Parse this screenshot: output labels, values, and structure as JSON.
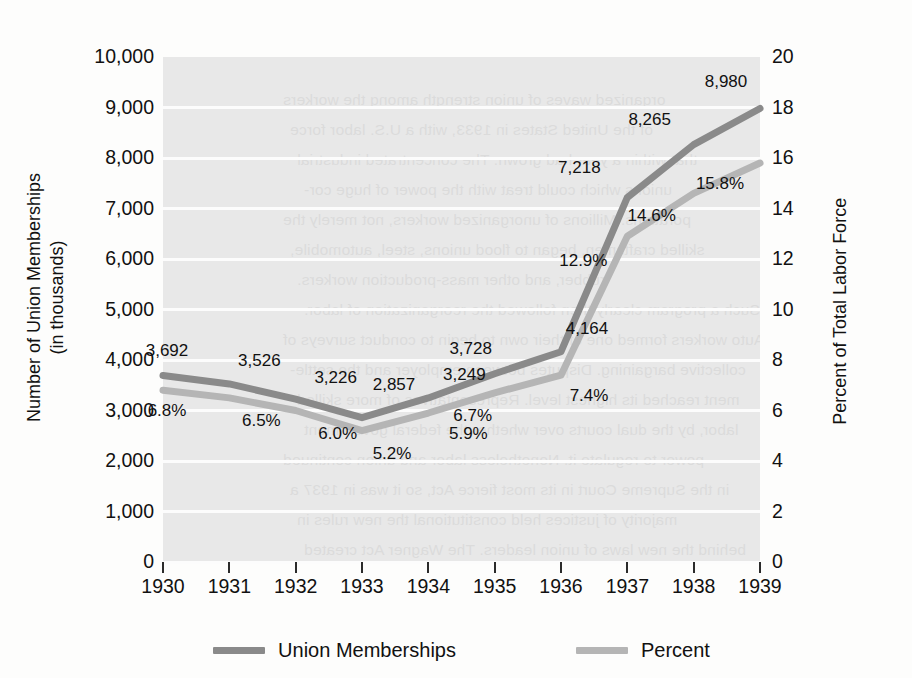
{
  "chart_data": {
    "type": "line",
    "title": "",
    "xlabel": "",
    "categories": [
      "1930",
      "1931",
      "1932",
      "1933",
      "1934",
      "1935",
      "1936",
      "1937",
      "1938",
      "1939"
    ],
    "grid": true,
    "legend_position": "bottom",
    "series": [
      {
        "name": "Union Memberships",
        "axis": "left",
        "color": "#8a8a8a",
        "ylabel": "Number of Union Memberships\n(in thousands)",
        "ylim": [
          0,
          10000
        ],
        "yticks": [
          "10,000",
          "9,000",
          "8,000",
          "7,000",
          "6,000",
          "5,000",
          "4,000",
          "3,000",
          "2,000",
          "1,000",
          "0"
        ],
        "values": [
          3692,
          3526,
          3226,
          2857,
          3249,
          3728,
          4164,
          7218,
          8265,
          8980
        ],
        "labels": [
          "3,692",
          "3,526",
          "3,226",
          "2,857",
          "3,249",
          "3,728",
          "4,164",
          "7,218",
          "8,265",
          "8,980"
        ]
      },
      {
        "name": "Percent",
        "axis": "right",
        "color": "#b5b5b5",
        "ylabel": "Percent of Total Labor Force",
        "ylim": [
          0,
          20
        ],
        "yticks": [
          "20",
          "18",
          "16",
          "14",
          "12",
          "10",
          "8",
          "6",
          "4",
          "2",
          "0"
        ],
        "values": [
          6.8,
          6.5,
          6.0,
          5.2,
          5.9,
          6.7,
          7.4,
          12.9,
          14.6,
          15.8
        ],
        "labels": [
          "6.8%",
          "6.5%",
          "6.0%",
          "5.2%",
          "5.9%",
          "6.7%",
          "7.4%",
          "12.9%",
          "14.6%",
          "15.8%"
        ]
      }
    ]
  },
  "axis_titles": {
    "left_line1": "Number of Union Memberships",
    "left_line2": "(in thousands)",
    "right": "Percent of Total Labor Force"
  },
  "legend": {
    "items": [
      {
        "label": "Union Memberships",
        "color": "#8a8a8a"
      },
      {
        "label": "Percent",
        "color": "#b5b5b5"
      }
    ]
  },
  "bleed_text": [
    "organized waves of union strength among the workers",
    "of the United States in 1933, with a U.S. labor force",
    "that within a year had grown. The concentrated industrial",
    "unions which could treat with the power of huge cor-",
    "porations. Millions of unorganized workers, not merely the",
    "skilled craftsmen, began to flood unions, steel, automobile,",
    "rubber, and other mass-production workers.",
    "Such a program clearly then followed the reorganization of labor.",
    "Auto workers formed one of their own to begin to conduct surveys of",
    "collective bargaining. Disputes between employer and the settle-",
    "ment reached its highest level. Representatives of more skilled",
    "labor, by the dual courts over whether the federal government",
    "power to regulate it. Nonetheless labor and union continued",
    "in the Supreme Court in its most fierce Act, so it was in 1937 a",
    "majority of justices held constitutional the new rules in",
    "behind the new laws of union leaders. The Wagner Act created"
  ]
}
